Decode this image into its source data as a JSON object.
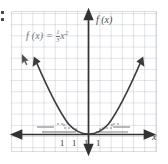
{
  "figure": {
    "background_color": "#ffffff",
    "grid_color": "#96a0af",
    "axis_color": "#333333",
    "curve_color": "#3a3a3a",
    "helper_color": "#9b9b9b"
  },
  "equation": {
    "lhs": "f (x)",
    "equals": "=",
    "numerator": "1",
    "denominator": "3",
    "variable": "x",
    "exponent": "2",
    "full_text": "f (x) = 1/3 x²",
    "color": "#6f7277"
  },
  "axes": {
    "y_label": "f (x)",
    "x_label": "x",
    "y_arrow_up": "up-arrow",
    "y_arrow_down": "down-arrow",
    "x_arrow_left": "left-arrow",
    "x_arrow_right": "right-arrow"
  },
  "ticks": {
    "x_labels": [
      {
        "text": "1",
        "left": 60
      },
      {
        "text": "1",
        "left": 72
      },
      {
        "text": "1",
        "left": 84
      },
      {
        "text": "1",
        "left": 96
      }
    ]
  },
  "chart_data": {
    "type": "line",
    "title": "",
    "xlabel": "x",
    "ylabel": "f (x)",
    "function": "f(x) = (1/3)x^2",
    "coefficient": 0.3333333333,
    "vertex": [
      0,
      0
    ],
    "opens": "up",
    "xlim": [
      -6.9,
      6.2
    ],
    "ylim": [
      -1.6,
      11.0
    ],
    "grid": true,
    "legend": "none",
    "x": [
      -5.0,
      -4.5,
      -4.0,
      -3.5,
      -3.0,
      -2.5,
      -2.0,
      -1.5,
      -1.0,
      -0.5,
      0.0,
      0.5,
      1.0,
      1.5,
      2.0,
      2.5,
      3.0,
      3.5,
      4.0,
      4.5,
      5.0
    ],
    "y": [
      8.33,
      6.75,
      5.33,
      4.08,
      3.0,
      2.08,
      1.33,
      0.75,
      0.33,
      0.08,
      0.0,
      0.08,
      0.33,
      0.75,
      1.33,
      2.08,
      3.0,
      4.08,
      5.33,
      6.75,
      8.33
    ],
    "annotations": [
      {
        "kind": "arrowhead",
        "at": "left-branch-end"
      },
      {
        "kind": "arrowhead",
        "at": "right-branch-end"
      },
      {
        "kind": "dashed-step",
        "side": "left"
      },
      {
        "kind": "dashed-step",
        "side": "right"
      },
      {
        "kind": "gray-rule",
        "side": "left"
      },
      {
        "kind": "gray-rule",
        "side": "right"
      }
    ]
  },
  "artifacts": {
    "cursor": "mouse-pointer",
    "edge_marks": "colon-marks"
  }
}
